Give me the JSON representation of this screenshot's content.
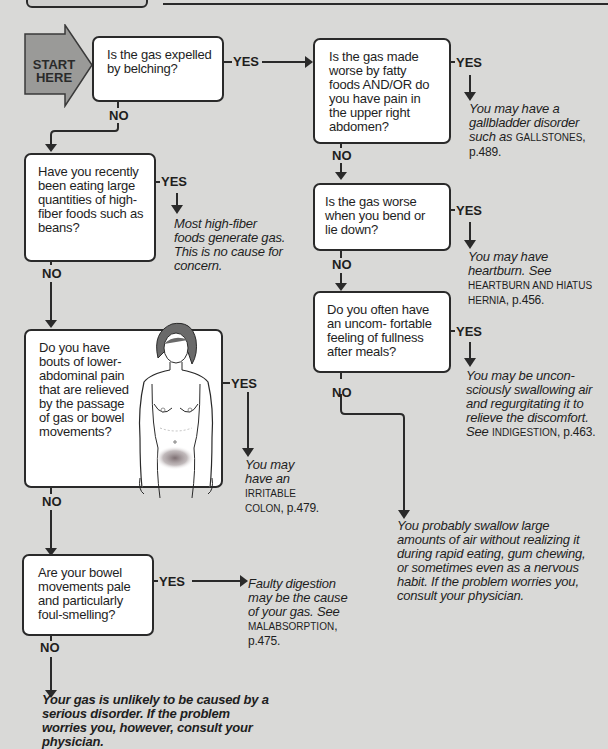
{
  "start": {
    "line1": "START",
    "line2": "HERE"
  },
  "labels": {
    "yes": "YES",
    "no": "NO"
  },
  "colors": {
    "background": "#d9d9d7",
    "box": "#ffffff",
    "line": "#2a2a2a",
    "start_arrow": "#9a9a98"
  },
  "questions": [
    {
      "id": "q1",
      "text": "Is the gas expelled by belching?"
    },
    {
      "id": "q2",
      "text": "Is the gas made worse by fatty foods AND/OR do you have pain in the upper right abdomen?"
    },
    {
      "id": "q3",
      "text": "Have you recently been eating large quantities of high-fiber foods such as beans?"
    },
    {
      "id": "q4",
      "text": "Is the gas worse when you bend or lie down?"
    },
    {
      "id": "q5",
      "text": "Do you often have an uncom- fortable feeling of fullness after meals?"
    },
    {
      "id": "q6",
      "text": "Do you have bouts of lower- abdominal pain that are relieved by the passage of gas or bowel movements?"
    },
    {
      "id": "q7",
      "text": "Are your bowel movements pale and particularly foul-smelling?"
    }
  ],
  "outcomes": {
    "gallbladder": {
      "text": "You may have a gallbladder disorder such as",
      "ref": "GALLSTONES",
      "page": ", p.489."
    },
    "fiber": {
      "text": "Most high-fiber foods generate gas. This is no cause for concern."
    },
    "heartburn": {
      "text": "You may have heartburn. See",
      "ref": "HEARTBURN AND HIATUS HERNIA",
      "page": ", p.456."
    },
    "air": {
      "text": "You may be uncon- sciously swallowing air and regurgitating it to relieve the discomfort. See",
      "ref": "INDIGESTION",
      "page": ", p.463."
    },
    "colon": {
      "text": "You may have an",
      "ref": "IRRITABLE COLON",
      "page": ", p.479."
    },
    "swallow": {
      "text": "You probably swallow large amounts of air without realizing it during rapid eating, gum chewing, or sometimes even as a nervous habit. If the problem worries you, consult your physician."
    },
    "malabsorption": {
      "text": "Faulty digestion may be the cause of your gas. See",
      "ref": "MALABSORPTION",
      "page": ", p.475."
    },
    "final": {
      "text": "Your gas is unlikely to be caused by a serious disorder. If the problem worries you, however, consult your physician."
    }
  },
  "illustration": {
    "name": "female torso figure with lower-abdominal shading"
  }
}
